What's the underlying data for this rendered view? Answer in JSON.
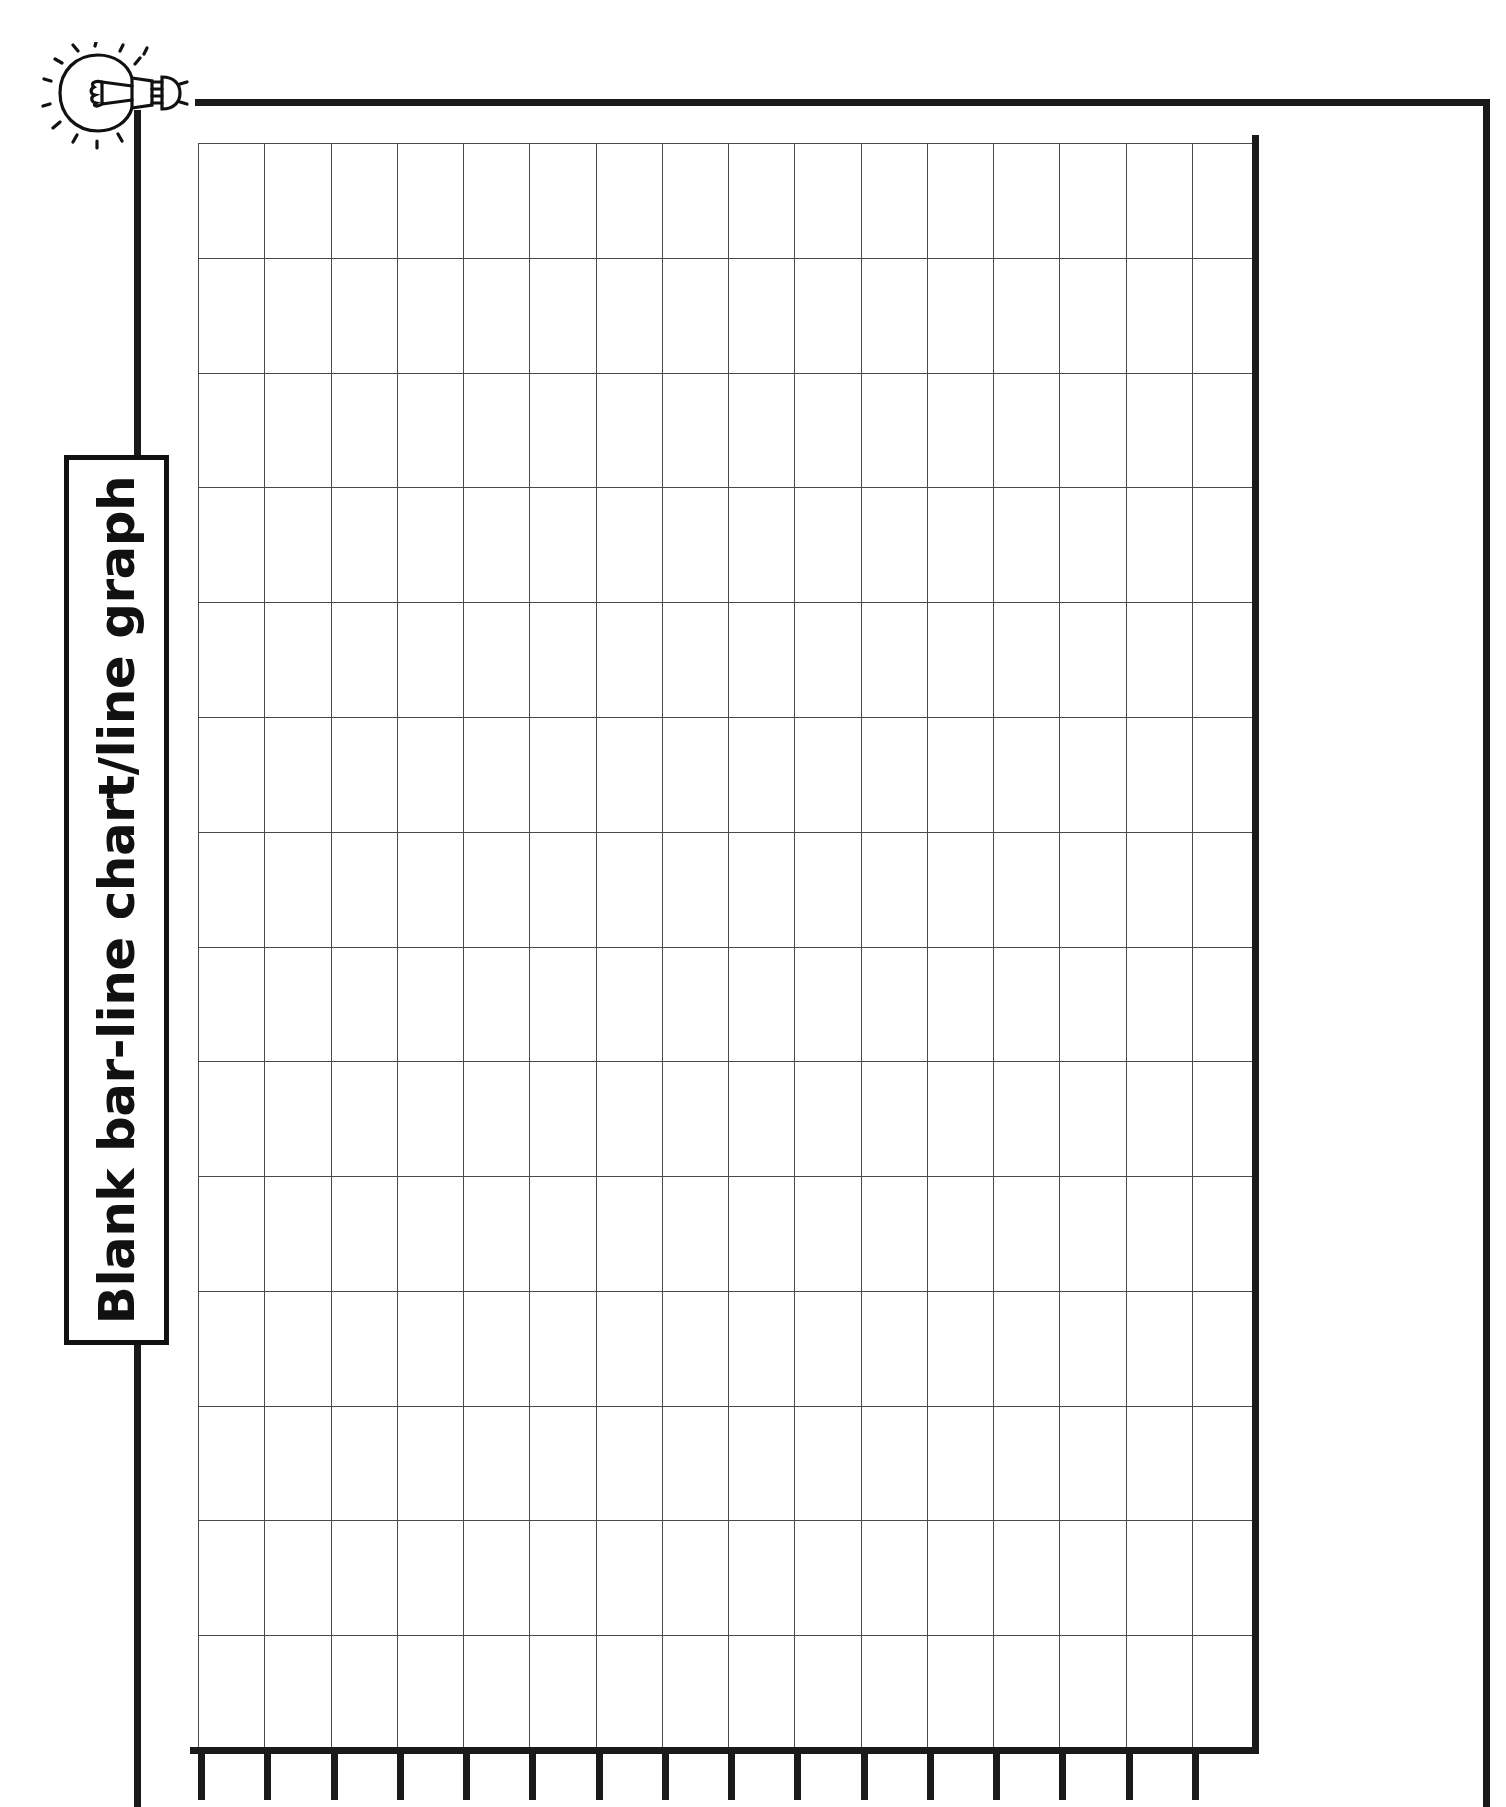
{
  "page": {
    "title": "Blank bar-line chart/line graph",
    "background_color": "#ffffff",
    "ink_color": "#111111",
    "grid_line_color": "#4a4a4a",
    "width": 1506,
    "height": 1807
  },
  "decoration": {
    "icon": "lightbulb-icon",
    "icon_label": "Idea light bulb"
  },
  "chart_data": {
    "type": "bar",
    "title": "Blank bar-line chart/line graph",
    "subtitle": "",
    "xlabel": "",
    "ylabel": "",
    "categories": [],
    "values": [],
    "series": [],
    "grid": true,
    "legend": "none",
    "x_columns": 16,
    "y_rows": 14,
    "x_tick_count": 16,
    "x_tick_labels": [],
    "y_tick_labels": [],
    "xlim": [
      0,
      16
    ],
    "ylim": [
      0,
      14
    ],
    "note": "Empty printable grid template - no plotted data"
  }
}
